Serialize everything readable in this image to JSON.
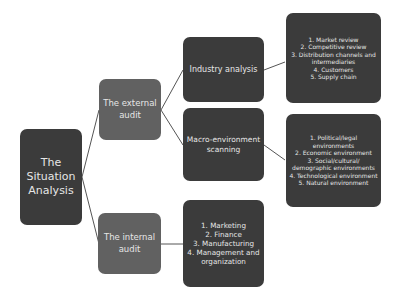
{
  "diagram": {
    "root": {
      "label": "The Situation Analysis"
    },
    "branches": [
      {
        "label": "The external audit",
        "children": [
          {
            "label": "Industry analysis",
            "items": [
              "1. Market review",
              "2. Competitive review",
              "3. Distribution channels and intermediaries",
              "4. Customers",
              "5. Supply chain"
            ]
          },
          {
            "label": "Macro-environment scanning",
            "items": [
              "1. Political/legal environments",
              "2. Economic environment",
              "3. Social/cultural/ demographic environments",
              "4. Technological environment",
              "5. Natural environment"
            ]
          }
        ]
      },
      {
        "label": "The internal audit",
        "items": [
          "1. Marketing",
          "2. Finance",
          "3. Manufacturing",
          "4. Management and organization"
        ]
      }
    ],
    "colors": {
      "dark": "#3b3b3b",
      "mid": "#616161",
      "connector": "#555555",
      "text": "#e6e6e6"
    }
  }
}
